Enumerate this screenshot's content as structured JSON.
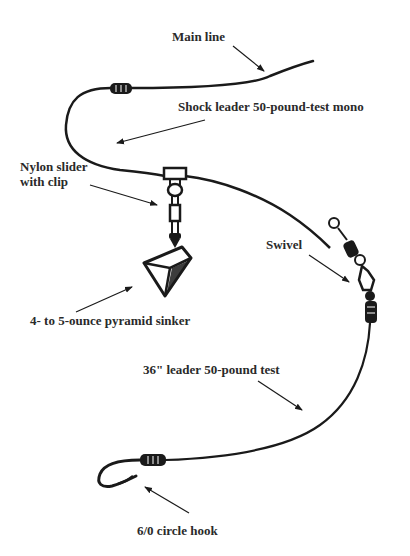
{
  "diagram": {
    "type": "fishing-rig",
    "labels": {
      "main_line": "Main line",
      "shock_leader": "Shock leader 50-pound-test mono",
      "slider_line1": "Nylon slider",
      "slider_line2": "with clip",
      "swivel": "Swivel",
      "sinker": "4- to 5-ounce pyramid sinker",
      "leader": "36\" leader 50-pound test",
      "hook": "6/0 circle hook"
    },
    "colors": {
      "ink": "#1a1a1a",
      "text": "#2a2a2a",
      "background": "#ffffff"
    }
  }
}
